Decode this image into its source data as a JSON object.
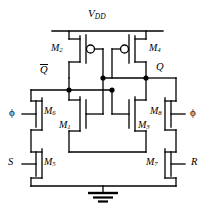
{
  "figure": {
    "type": "circuit-schematic",
    "background": "#ffffff",
    "line_color": "#000000"
  },
  "rails": {
    "supply_label": "V",
    "supply_sub": "DD",
    "ground_symbol": "earth-ground"
  },
  "nodes": {
    "left_output": "Q",
    "left_output_overbar": true,
    "right_output": "Q",
    "right_output_overbar": false
  },
  "devices": [
    {
      "id": "M2",
      "name": "M",
      "sub": "2",
      "kind": "pmos",
      "side": "left",
      "role": "pull-up"
    },
    {
      "id": "M4",
      "name": "M",
      "sub": "4",
      "kind": "pmos",
      "side": "right",
      "role": "pull-up"
    },
    {
      "id": "M1",
      "name": "M",
      "sub": "1",
      "kind": "nmos",
      "side": "left",
      "role": "pull-down"
    },
    {
      "id": "M3",
      "name": "M",
      "sub": "3",
      "kind": "nmos",
      "side": "right",
      "role": "pull-down"
    },
    {
      "id": "M6",
      "name": "M",
      "sub": "6",
      "kind": "nmos",
      "side": "left",
      "role": "clock-pass"
    },
    {
      "id": "M8",
      "name": "M",
      "sub": "8",
      "kind": "nmos",
      "side": "right",
      "role": "clock-pass"
    },
    {
      "id": "M5",
      "name": "M",
      "sub": "5",
      "kind": "nmos",
      "side": "left",
      "role": "set"
    },
    {
      "id": "M7",
      "name": "M",
      "sub": "7",
      "kind": "nmos",
      "side": "right",
      "role": "reset"
    }
  ],
  "ports": {
    "set": "S",
    "reset": "R",
    "clock_left": "ϕ",
    "clock_right": "ϕ"
  }
}
